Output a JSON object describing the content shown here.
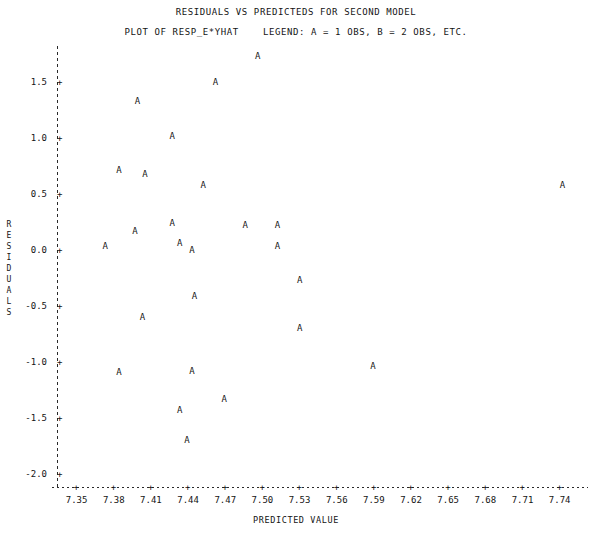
{
  "title": {
    "main": "RESIDUALS VS PREDICTEDS FOR SECOND MODEL",
    "sub": "PLOT OF RESP_E*YHAT    LEGEND: A = 1 OBS, B = 2 OBS, ETC."
  },
  "axis": {
    "ylabel_chars": [
      "R",
      "E",
      "S",
      "I",
      "D",
      "U",
      "A",
      "L",
      "S"
    ],
    "tick_mark": "+"
  },
  "chart_data": {
    "type": "scatter",
    "title": "RESIDUALS VS PREDICTEDS FOR SECOND MODEL",
    "subtitle": "PLOT OF RESP_E*YHAT    LEGEND: A = 1 OBS, B = 2 OBS, ETC.",
    "xlabel": "PREDICTED VALUE",
    "ylabel": "RESIDUALS",
    "legend": "A = 1 OBS, B = 2 OBS, ETC.",
    "marker": "A",
    "grid": false,
    "xlim": [
      7.335,
      7.758
    ],
    "ylim": [
      -2.12,
      1.82
    ],
    "xticks": [
      "7.35",
      "7.38",
      "7.41",
      "7.44",
      "7.47",
      "7.50",
      "7.53",
      "7.56",
      "7.59",
      "7.62",
      "7.65",
      "7.68",
      "7.71",
      "7.74"
    ],
    "xtick_values": [
      7.35,
      7.38,
      7.41,
      7.44,
      7.47,
      7.5,
      7.53,
      7.56,
      7.59,
      7.62,
      7.65,
      7.68,
      7.71,
      7.74
    ],
    "yticks": [
      "1.5",
      "1.0",
      "0.5",
      "0.0",
      "-0.5",
      "-1.0",
      "-1.5",
      "-2.0"
    ],
    "ytick_values": [
      1.5,
      1.0,
      0.5,
      0.0,
      -0.5,
      -1.0,
      -1.5,
      -2.0
    ],
    "points": [
      {
        "x": 7.497,
        "y": 1.73,
        "label": "A"
      },
      {
        "x": 7.463,
        "y": 1.5,
        "label": "A"
      },
      {
        "x": 7.4,
        "y": 1.33,
        "label": "A"
      },
      {
        "x": 7.428,
        "y": 1.02,
        "label": "A"
      },
      {
        "x": 7.385,
        "y": 0.71,
        "label": "A"
      },
      {
        "x": 7.406,
        "y": 0.68,
        "label": "A"
      },
      {
        "x": 7.453,
        "y": 0.58,
        "label": "A"
      },
      {
        "x": 7.743,
        "y": 0.58,
        "label": "A"
      },
      {
        "x": 7.428,
        "y": 0.24,
        "label": "A"
      },
      {
        "x": 7.487,
        "y": 0.22,
        "label": "A"
      },
      {
        "x": 7.513,
        "y": 0.22,
        "label": "A"
      },
      {
        "x": 7.398,
        "y": 0.17,
        "label": "A"
      },
      {
        "x": 7.374,
        "y": 0.03,
        "label": "A"
      },
      {
        "x": 7.434,
        "y": 0.06,
        "label": "A"
      },
      {
        "x": 7.444,
        "y": 0.0,
        "label": "A"
      },
      {
        "x": 7.513,
        "y": 0.03,
        "label": "A"
      },
      {
        "x": 7.531,
        "y": -0.27,
        "label": "A"
      },
      {
        "x": 7.446,
        "y": -0.41,
        "label": "A"
      },
      {
        "x": 7.404,
        "y": -0.6,
        "label": "A"
      },
      {
        "x": 7.531,
        "y": -0.7,
        "label": "A"
      },
      {
        "x": 7.385,
        "y": -1.09,
        "label": "A"
      },
      {
        "x": 7.444,
        "y": -1.08,
        "label": "A"
      },
      {
        "x": 7.59,
        "y": -1.04,
        "label": "A"
      },
      {
        "x": 7.47,
        "y": -1.33,
        "label": "A"
      },
      {
        "x": 7.434,
        "y": -1.43,
        "label": "A"
      },
      {
        "x": 7.44,
        "y": -1.7,
        "label": "A"
      }
    ]
  }
}
